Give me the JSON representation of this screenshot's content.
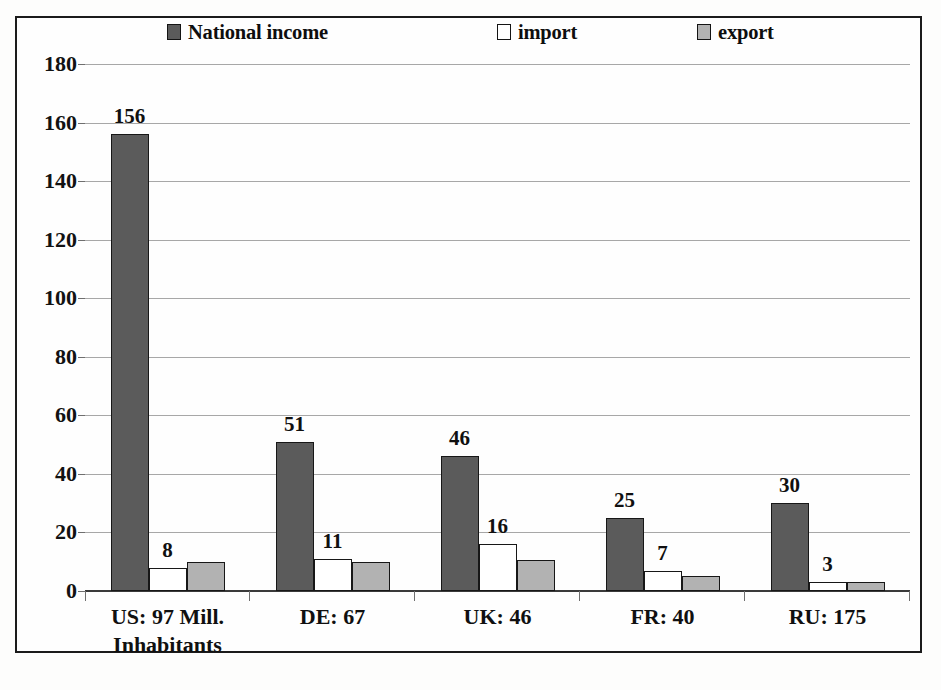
{
  "chart_data": {
    "type": "bar",
    "title": "",
    "subtitle": "",
    "xlabel": "",
    "ylabel": "",
    "ylim": [
      0,
      180
    ],
    "ytick_values": [
      0,
      20,
      40,
      60,
      80,
      100,
      120,
      140,
      160,
      180
    ],
    "ytick_labels": [
      "0",
      "20",
      "40",
      "60",
      "80",
      "100",
      "120",
      "140",
      "160",
      "180"
    ],
    "grid": true,
    "legend_position": "top",
    "categories": [
      "US: 97 Mill.\nInhabitants",
      "DE: 67",
      "UK: 46",
      "FR: 40",
      "RU: 175"
    ],
    "series": [
      {
        "name": "National income",
        "color": "#5b5b5b",
        "values": [
          156,
          51,
          46,
          25,
          30
        ],
        "data_labels": [
          "156",
          "51",
          "46",
          "25",
          "30"
        ]
      },
      {
        "name": "import",
        "color": "#ffffff",
        "values": [
          8,
          11,
          16,
          7,
          3
        ],
        "data_labels": [
          "8",
          "11",
          "16",
          "7",
          "3"
        ]
      },
      {
        "name": "export",
        "color": "#b2b2b2",
        "values": [
          10,
          10,
          10.5,
          5,
          3
        ],
        "data_labels": [
          "",
          "",
          "",
          "",
          ""
        ]
      }
    ],
    "annotations": []
  },
  "legend": {
    "items": [
      {
        "label": "National income",
        "swatch": "filled-dark-square-icon"
      },
      {
        "label": "import",
        "swatch": "empty-square-icon"
      },
      {
        "label": "export",
        "swatch": "filled-light-square-icon"
      }
    ]
  },
  "axes": {
    "y": {
      "ticks": [
        "180",
        "160",
        "140",
        "120",
        "100",
        "80",
        "60",
        "40",
        "20",
        "0"
      ]
    },
    "x": {
      "ticks": [
        "US: 97 Mill.\nInhabitants",
        "DE: 67",
        "UK: 46",
        "FR: 40",
        "RU: 175"
      ]
    }
  },
  "colors": {
    "national_income": "#5b5b5b",
    "import": "#ffffff",
    "export": "#b2b2b2",
    "frame": "#1b1b1b",
    "gridline": "#a7a7a7",
    "text": "#101010"
  }
}
